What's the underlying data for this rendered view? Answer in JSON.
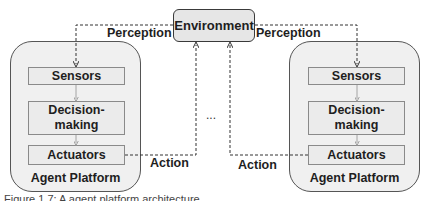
{
  "diagram": {
    "environment": {
      "label": "Environment"
    },
    "edges": {
      "perception_left": "Perception",
      "perception_right": "Perception",
      "action_left": "Action",
      "action_right": "Action"
    },
    "ellipsis": "...",
    "platforms": [
      {
        "label": "Agent Platform",
        "components": [
          {
            "label": "Sensors"
          },
          {
            "label": "Decision-\nmaking"
          },
          {
            "label": "Actuators"
          }
        ]
      },
      {
        "label": "Agent Platform",
        "components": [
          {
            "label": "Sensors"
          },
          {
            "label": "Decision-\nmaking"
          },
          {
            "label": "Actuators"
          }
        ]
      }
    ],
    "caption": "Figure 1.7: A agent platform architecture"
  },
  "colors": {
    "panel_fill": "#f0f0f0",
    "box_fill": "#ebebeb",
    "env_fill": "#e6e6e6",
    "wire": "#333333",
    "connector": "#9a9a9a"
  }
}
